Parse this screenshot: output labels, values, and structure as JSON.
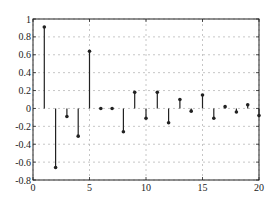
{
  "chart_data": {
    "type": "stem",
    "title": "",
    "xlabel": "",
    "ylabel": "",
    "xlim": [
      0,
      20
    ],
    "ylim": [
      -0.8,
      1
    ],
    "grid": true,
    "grid_style": "dashed",
    "legend": null,
    "x_ticks": [
      "0",
      "5",
      "10",
      "15",
      "20"
    ],
    "y_ticks": [
      "-0.8",
      "-0.6",
      "-0.4",
      "-0.2",
      "0",
      "0.2",
      "0.4",
      "0.6",
      "0.8",
      "1"
    ],
    "x": [
      1,
      2,
      3,
      4,
      5,
      6,
      7,
      8,
      9,
      10,
      11,
      12,
      13,
      14,
      15,
      16,
      17,
      18,
      19,
      20
    ],
    "values": [
      0.91,
      -0.66,
      -0.09,
      -0.31,
      0.64,
      0.0,
      0.0,
      -0.26,
      0.18,
      -0.11,
      0.18,
      -0.16,
      0.1,
      -0.03,
      0.15,
      -0.11,
      0.02,
      -0.04,
      0.04,
      -0.08
    ],
    "colors": {
      "stem": "#222222",
      "grid": "#b8b8b8",
      "axes": "#222222"
    }
  }
}
